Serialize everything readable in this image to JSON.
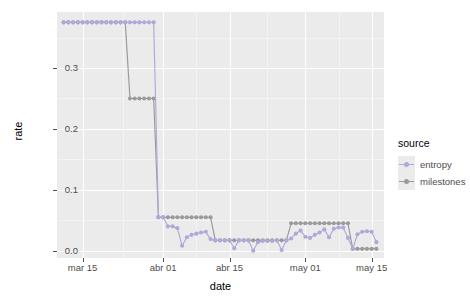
{
  "chart_data": {
    "type": "line",
    "title": "",
    "xlabel": "date",
    "ylabel": "rate",
    "grid": true,
    "legend_position": "right",
    "legend_title": "source",
    "ylim": [
      -0.012,
      0.392
    ],
    "xlim": [
      "mar 11",
      "may 17"
    ],
    "y_ticks": [
      "0.0",
      "0.1",
      "0.2",
      "0.3"
    ],
    "y_tick_values": [
      0.0,
      0.1,
      0.2,
      0.3
    ],
    "x_ticks": [
      "mar 15",
      "abr 01",
      "abr 15",
      "may 01",
      "may 15"
    ],
    "x_tick_values": [
      4,
      21,
      35,
      51,
      65
    ],
    "colors": {
      "entropy": "#b0a8d8",
      "milestones": "#9a9a9a",
      "panel": "#ebebeb",
      "grid": "#ffffff",
      "axis_text": "#4d4d4d"
    },
    "series": [
      {
        "name": "entropy",
        "color": "#b0a8d8",
        "x": [
          0,
          1,
          2,
          3,
          4,
          5,
          6,
          7,
          8,
          9,
          10,
          11,
          12,
          13,
          14,
          15,
          16,
          17,
          18,
          19,
          20,
          21,
          22,
          23,
          24,
          25,
          26,
          27,
          28,
          29,
          30,
          31,
          32,
          33,
          34,
          35,
          36,
          37,
          38,
          39,
          40,
          41,
          42,
          43,
          44,
          45,
          46,
          47,
          48,
          49,
          50,
          51,
          52,
          53,
          54,
          55,
          56,
          57,
          58,
          59,
          60,
          61,
          62,
          63,
          64,
          65,
          66
        ],
        "values": [
          0.375,
          0.375,
          0.375,
          0.375,
          0.375,
          0.375,
          0.375,
          0.375,
          0.375,
          0.375,
          0.375,
          0.375,
          0.375,
          0.375,
          0.375,
          0.375,
          0.375,
          0.375,
          0.375,
          0.375,
          0.055,
          0.055,
          0.04,
          0.04,
          0.037,
          0.008,
          0.022,
          0.026,
          0.028,
          0.03,
          0.031,
          0.019,
          0.017,
          0.017,
          0.017,
          0.017,
          0.004,
          0.017,
          0.017,
          0.017,
          0.0,
          0.014,
          0.016,
          0.016,
          0.016,
          0.017,
          0.001,
          0.017,
          0.02,
          0.028,
          0.033,
          0.023,
          0.021,
          0.026,
          0.03,
          0.035,
          0.022,
          0.036,
          0.038,
          0.038,
          0.021,
          0.003,
          0.027,
          0.031,
          0.032,
          0.031,
          0.014
        ]
      },
      {
        "name": "milestones",
        "color": "#9a9a9a",
        "x": [
          0,
          1,
          2,
          3,
          4,
          5,
          6,
          7,
          8,
          9,
          10,
          11,
          12,
          13,
          14,
          15,
          16,
          17,
          18,
          19,
          20,
          21,
          22,
          23,
          24,
          25,
          26,
          27,
          28,
          29,
          30,
          31,
          32,
          33,
          34,
          35,
          36,
          37,
          38,
          39,
          40,
          41,
          42,
          43,
          44,
          45,
          46,
          47,
          48,
          49,
          50,
          51,
          52,
          53,
          54,
          55,
          56,
          57,
          58,
          59,
          60,
          61,
          62,
          63,
          64,
          65,
          66
        ],
        "values": [
          0.375,
          0.375,
          0.375,
          0.375,
          0.375,
          0.375,
          0.375,
          0.375,
          0.375,
          0.375,
          0.375,
          0.375,
          0.375,
          0.375,
          0.25,
          0.25,
          0.25,
          0.25,
          0.25,
          0.25,
          0.055,
          0.055,
          0.055,
          0.055,
          0.055,
          0.055,
          0.055,
          0.055,
          0.055,
          0.055,
          0.055,
          0.055,
          0.017,
          0.017,
          0.017,
          0.017,
          0.017,
          0.017,
          0.017,
          0.017,
          0.017,
          0.017,
          0.017,
          0.017,
          0.017,
          0.017,
          0.017,
          0.017,
          0.045,
          0.045,
          0.045,
          0.045,
          0.045,
          0.045,
          0.045,
          0.045,
          0.045,
          0.045,
          0.045,
          0.045,
          0.045,
          0.003,
          0.003,
          0.003,
          0.003,
          0.003,
          0.003
        ]
      }
    ]
  }
}
